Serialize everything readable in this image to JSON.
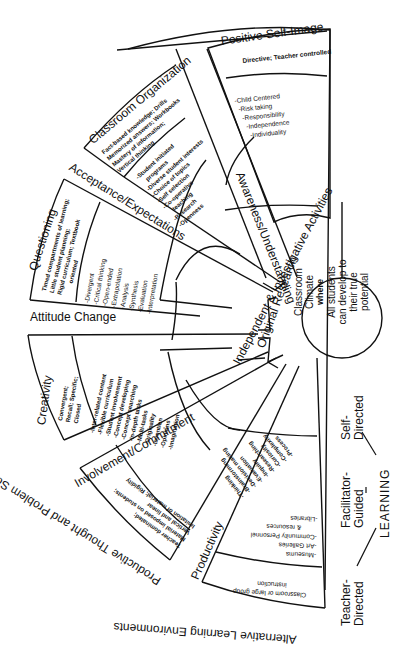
{
  "center": {
    "title_line1": "Classroom",
    "title_line2": "Climate",
    "title_line3": "where",
    "title_line4": "All students",
    "title_line5": "can develop to",
    "title_line6": "their true",
    "title_line7": "potential"
  },
  "inner_ring": {
    "label_a": "Independent & Investigative Activities",
    "label_b": "Original Research"
  },
  "segments": [
    {
      "title": "Positive Self-Image",
      "outer": "Directive; Teacher controlled",
      "inner": [
        "-Child Centered",
        "-Risk taking",
        "-Responsibility",
        "-Independence",
        "-Individuality"
      ]
    },
    {
      "title": "Classroom Organization",
      "outer": [
        "Fact-based knowledge; Drills",
        "Memorized answers; Workbooks",
        "Mastery of information;",
        "Vertical thinking"
      ],
      "inner": [
        "-Student initiated",
        "programs",
        "-Diverse student interests",
        "-Choice of topics",
        "-Self selection",
        "-Co-operative",
        "teaching",
        "-Research",
        "-Openness"
      ]
    },
    {
      "title": "Questioning",
      "outer": [
        "Timed compartments of learning;",
        "Little student planning;",
        "Rigid curriculum; Textbook",
        "oriented"
      ],
      "inner": [
        "-Divergent",
        "-Critical thinking",
        "-Open-ended",
        "-Extrapolation",
        "-Analysis",
        "-Synthesis",
        "-Evaluation",
        "-Interpretation"
      ]
    },
    {
      "title": "Creativity",
      "outer": [
        "Convergent;",
        "Recall; Specific;",
        "Closed"
      ],
      "inner": [
        "-Inter-related content",
        "-Flexible curriculum",
        "-Student involvement",
        "-Concept developing",
        "-Concept searching",
        "-In-depth tasks",
        "-Multi-tasks",
        "-Originality",
        "-Invention",
        "-Opinions",
        "-Imagination"
      ]
    },
    {
      "title": "Productive Thought and Problem Solving",
      "outer": [
        "Teacher dominated;",
        "Material imposed on students;",
        "Vertical and linear",
        "Imitation of material; Rigidity"
      ],
      "inner": [
        "-Thinking",
        "-Brainstorming",
        "-Decision making",
        "-Evaluation",
        "-Inquiry",
        "-Researching",
        "-Curiosity",
        "-Complexity",
        "-Process"
      ]
    },
    {
      "title": "Alternative Learning Environments",
      "outer": [
        "Classroom or large group",
        "instruction"
      ],
      "inner": [
        "-Museums",
        "-Art Galleries",
        "-Community Personnel",
        "& resources",
        "-Libraries"
      ]
    }
  ],
  "spoke_labels": {
    "awareness": "Awareness/Understanding",
    "acceptance": "Acceptance/Expectations",
    "attitude": "Attitude Change",
    "involvement": "Involvement/Commitment",
    "productivity": "Productivity"
  },
  "learning_scale": {
    "self": "Self-Directed",
    "facilitator": "Facilitator-Guided",
    "teacher": "Teacher-Directed",
    "learning": "LEARNING"
  },
  "colors": {
    "ink": "#111111",
    "paper": "#ffffff"
  }
}
